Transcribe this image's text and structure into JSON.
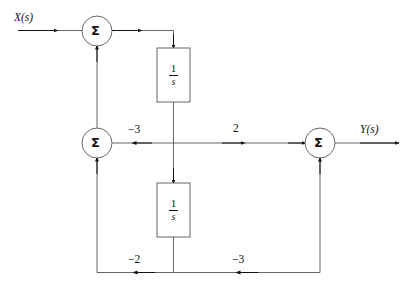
{
  "figure": {
    "type": "control-system-block-diagram",
    "title": "",
    "background_color": "#ffffff",
    "line_color": "#555555",
    "text_color": "#111111"
  },
  "signals": {
    "input_label": "X(s)",
    "output_label": "Y(s)"
  },
  "summers": [
    {
      "id": "summer-top-left",
      "label": "Σ",
      "cx": 97,
      "cy": 31,
      "r": 15
    },
    {
      "id": "summer-middle-left",
      "label": "Σ",
      "cx": 97,
      "cy": 143,
      "r": 15
    },
    {
      "id": "summer-right",
      "label": "Σ",
      "cx": 320,
      "cy": 143,
      "r": 15
    }
  ],
  "blocks": [
    {
      "id": "integrator-top",
      "numerator": "1",
      "denominator": "s",
      "transfer_function": "1/s",
      "x": 157,
      "y": 48,
      "width": 33,
      "height": 54
    },
    {
      "id": "integrator-bottom",
      "numerator": "1",
      "denominator": "s",
      "transfer_function": "1/s",
      "x": 157,
      "y": 183,
      "width": 33,
      "height": 54
    }
  ],
  "gains": [
    {
      "id": "gain-middle-left",
      "label": "−3",
      "value": -3,
      "x": 128,
      "y": 124
    },
    {
      "id": "gain-middle-right",
      "label": "2",
      "value": 2,
      "x": 233,
      "y": 123
    },
    {
      "id": "gain-bottom-left",
      "label": "−2",
      "value": -2,
      "x": 128,
      "y": 254
    },
    {
      "id": "gain-bottom-right",
      "label": "−3",
      "value": -3,
      "x": 232,
      "y": 254
    }
  ]
}
